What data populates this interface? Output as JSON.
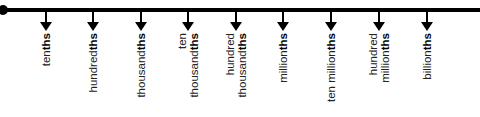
{
  "diagram": {
    "title": "",
    "line_color": "#000000",
    "ticks": [
      {
        "x": 46,
        "lines": [
          {
            "text": "ten",
            "bold": "ths"
          }
        ]
      },
      {
        "x": 93,
        "lines": [
          {
            "text": "hundred",
            "bold": "ths"
          }
        ]
      },
      {
        "x": 141,
        "lines": [
          {
            "text": "thousand",
            "bold": "ths"
          }
        ]
      },
      {
        "x": 188,
        "lines": [
          {
            "text": "ten",
            "bold": ""
          },
          {
            "text": "thousand",
            "bold": "ths"
          }
        ]
      },
      {
        "x": 236,
        "lines": [
          {
            "text": "hundred",
            "bold": ""
          },
          {
            "text": "thousand",
            "bold": "ths"
          }
        ]
      },
      {
        "x": 283,
        "lines": [
          {
            "text": "million",
            "bold": "ths"
          }
        ]
      },
      {
        "x": 331,
        "lines": [
          {
            "text": "ten million",
            "bold": "ths"
          }
        ]
      },
      {
        "x": 379,
        "lines": [
          {
            "text": "hundred",
            "bold": ""
          },
          {
            "text": "million",
            "bold": "ths"
          }
        ]
      },
      {
        "x": 427,
        "lines": [
          {
            "text": "billion",
            "bold": "ths"
          }
        ]
      }
    ]
  }
}
